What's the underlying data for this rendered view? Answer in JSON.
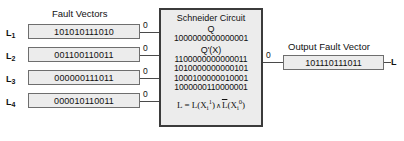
{
  "diagram": {
    "headings": {
      "fault_vectors": "Fault Vectors",
      "output_fault_vector": "Output Fault Vector"
    },
    "inputs": [
      {
        "label": "L",
        "index": "1",
        "value": "101010111010",
        "line_label": "0"
      },
      {
        "label": "L",
        "index": "2",
        "value": "001100110011",
        "line_label": "0"
      },
      {
        "label": "L",
        "index": "3",
        "value": "000000111011",
        "line_label": "0"
      },
      {
        "label": "L",
        "index": "4",
        "value": "000010110011",
        "line_label": "0"
      }
    ],
    "circuit": {
      "title": "Schneider Circuit",
      "q_label": "Q",
      "q_value": "1000000000000001",
      "qx_label": "Q'(X)",
      "qx_rows": [
        "1100000000000011",
        "1010000000000101",
        "1000100000010001",
        "1000000110000001"
      ],
      "formula": {
        "lhs": "L",
        "eq": "=",
        "term1_fn": "L",
        "term1_var": "X",
        "term1_sub": "i",
        "term1_sup": "1",
        "and": "∧",
        "term2_fn": "L",
        "term2_var": "X",
        "term2_sub": "i",
        "term2_sup": "0"
      }
    },
    "output": {
      "line_label": "0",
      "value": "101110111011",
      "label": "L"
    },
    "colors": {
      "box_fill": "#ececec",
      "box_border": "#6e6e6e",
      "circuit_border": "#3b3b3b",
      "line": "#4a4a4a",
      "text": "#111111",
      "background": "#ffffff"
    }
  }
}
